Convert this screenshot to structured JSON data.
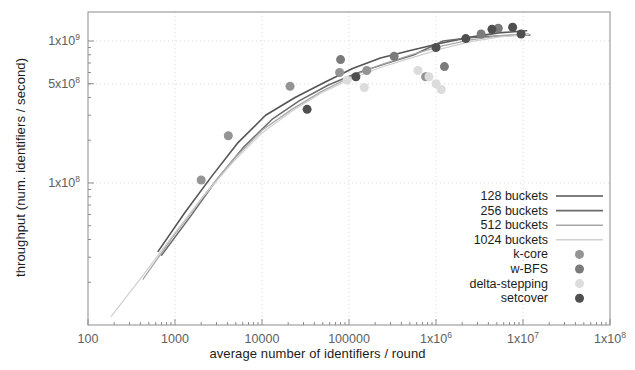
{
  "chart_data": {
    "type": "scatter",
    "title": "",
    "xlabel": "average number of identifiers / round",
    "ylabel": "throughput (num. identifiers / second)",
    "xscale": "log",
    "yscale": "log",
    "xlim": [
      100,
      100000000
    ],
    "ylim": [
      10000000,
      1600000000
    ],
    "grid": true,
    "legend_position": "lower right",
    "xticks": [
      {
        "value": 100,
        "label": "100"
      },
      {
        "value": 1000,
        "label": "1000"
      },
      {
        "value": 10000,
        "label": "10000"
      },
      {
        "value": 100000,
        "label": "100000"
      },
      {
        "value": 1000000,
        "label": "1x10",
        "exp": "6"
      },
      {
        "value": 10000000,
        "label": "1x10",
        "exp": "7"
      },
      {
        "value": 100000000,
        "label": "1x10",
        "exp": "8"
      }
    ],
    "yticks": [
      {
        "value": 1000000000,
        "label": "1x10",
        "exp": "9"
      },
      {
        "value": 500000000,
        "label": "5x10",
        "exp": "8"
      },
      {
        "value": 100000000,
        "label": "1x10",
        "exp": "8"
      }
    ],
    "series": [
      {
        "name": "128 buckets",
        "kind": "line",
        "color": "#555555",
        "width": 1.6,
        "points": [
          [
            640,
            33000000
          ],
          [
            1300,
            62000000
          ],
          [
            2600,
            110000000
          ],
          [
            5200,
            190000000
          ],
          [
            11000,
            300000000
          ],
          [
            24000,
            400000000
          ],
          [
            52000,
            510000000
          ],
          [
            110000,
            640000000
          ],
          [
            230000,
            760000000
          ],
          [
            520000,
            860000000
          ],
          [
            1100000,
            960000000
          ],
          [
            2400000,
            1060000000
          ],
          [
            5200000,
            1140000000
          ],
          [
            11000000,
            1180000000
          ]
        ]
      },
      {
        "name": "256 buckets",
        "kind": "line",
        "color": "#6a6a6a",
        "width": 1.5,
        "points": [
          [
            700,
            31000000
          ],
          [
            1500,
            58000000
          ],
          [
            3000,
            105000000
          ],
          [
            6200,
            180000000
          ],
          [
            13000,
            280000000
          ],
          [
            27000,
            380000000
          ],
          [
            58000,
            490000000
          ],
          [
            120000,
            590000000
          ],
          [
            260000,
            690000000
          ],
          [
            560000,
            800000000
          ],
          [
            1200000,
            1000000000
          ],
          [
            2600000,
            1060000000
          ],
          [
            5600000,
            1090000000
          ],
          [
            12000000,
            1100000000
          ]
        ]
      },
      {
        "name": "512 buckets",
        "kind": "line",
        "color": "#a8a8a8",
        "width": 1.3,
        "points": [
          [
            430,
            21000000
          ],
          [
            950,
            42000000
          ],
          [
            2100,
            80000000
          ],
          [
            4600,
            145000000
          ],
          [
            10000,
            235000000
          ],
          [
            22000,
            330000000
          ],
          [
            48000,
            440000000
          ],
          [
            105000,
            560000000
          ],
          [
            230000,
            680000000
          ],
          [
            520000,
            800000000
          ],
          [
            1150000,
            920000000
          ],
          [
            2500000,
            1020000000
          ],
          [
            5400000,
            1090000000
          ],
          [
            11500000,
            1120000000
          ]
        ]
      },
      {
        "name": "1024 buckets",
        "kind": "line",
        "color": "#cfcfcf",
        "width": 1.2,
        "points": [
          [
            185,
            11500000
          ],
          [
            420,
            22000000
          ],
          [
            950,
            43000000
          ],
          [
            2100,
            80000000
          ],
          [
            4600,
            140000000
          ],
          [
            10000,
            225000000
          ],
          [
            22000,
            320000000
          ],
          [
            48000,
            430000000
          ],
          [
            105000,
            540000000
          ],
          [
            230000,
            650000000
          ],
          [
            520000,
            760000000
          ],
          [
            1150000,
            880000000
          ],
          [
            2500000,
            990000000
          ],
          [
            5400000,
            1070000000
          ],
          [
            11500000,
            1110000000
          ]
        ]
      },
      {
        "name": "k-core",
        "kind": "scatter",
        "color": "#949494",
        "size": 9,
        "points": [
          [
            2000,
            105000000
          ],
          [
            4100,
            215000000
          ],
          [
            21000,
            480000000
          ],
          [
            78000,
            600000000
          ],
          [
            160000,
            620000000
          ],
          [
            760000,
            560000000
          ]
        ]
      },
      {
        "name": "w-BFS",
        "kind": "scatter",
        "color": "#7b7b7b",
        "size": 9,
        "points": [
          [
            80000,
            740000000
          ],
          [
            330000,
            780000000
          ],
          [
            1250000,
            660000000
          ],
          [
            3300000,
            1120000000
          ],
          [
            5200000,
            1230000000
          ]
        ]
      },
      {
        "name": "delta-stepping",
        "kind": "scatter",
        "color": "#dcdcdc",
        "size": 9,
        "points": [
          [
            95000,
            530000000
          ],
          [
            150000,
            470000000
          ],
          [
            620000,
            620000000
          ],
          [
            830000,
            560000000
          ],
          [
            1000000,
            500000000
          ],
          [
            1150000,
            455000000
          ]
        ]
      },
      {
        "name": "setcover",
        "kind": "scatter",
        "color": "#4f4f4f",
        "size": 9,
        "points": [
          [
            33000,
            330000000
          ],
          [
            120000,
            560000000
          ],
          [
            1000000,
            900000000
          ],
          [
            2200000,
            1040000000
          ],
          [
            4400000,
            1210000000
          ],
          [
            7600000,
            1250000000
          ],
          [
            9500000,
            1120000000
          ]
        ]
      }
    ],
    "legend_entries": [
      {
        "label": "128 buckets",
        "kind": "line",
        "color": "#555555"
      },
      {
        "label": "256 buckets",
        "kind": "line",
        "color": "#6a6a6a"
      },
      {
        "label": "512 buckets",
        "kind": "line",
        "color": "#a8a8a8"
      },
      {
        "label": "1024 buckets",
        "kind": "line",
        "color": "#cfcfcf"
      },
      {
        "label": "k-core",
        "kind": "marker",
        "color": "#949494"
      },
      {
        "label": "w-BFS",
        "kind": "marker",
        "color": "#7b7b7b"
      },
      {
        "label": "delta-stepping",
        "kind": "marker",
        "color": "#dcdcdc"
      },
      {
        "label": "setcover",
        "kind": "marker",
        "color": "#4f4f4f"
      }
    ],
    "axis_color": "#8c8c8c",
    "grid_color": "#d9d9d9"
  }
}
